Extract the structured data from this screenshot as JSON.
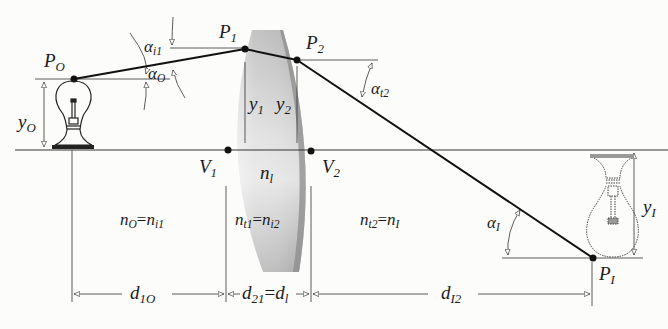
{
  "diagram": {
    "type": "thick-lens ray trace",
    "colors": {
      "background": "#fcfcfa",
      "ink": "#1a1a1a",
      "lens_light": "#e4e4e4",
      "lens_dark": "#9a9a9a"
    },
    "points": {
      "P_O": {
        "base": "P",
        "sub": "O"
      },
      "P_1": {
        "base": "P",
        "sub": "1"
      },
      "P_2": {
        "base": "P",
        "sub": "2"
      },
      "P_I": {
        "base": "P",
        "sub": "I"
      },
      "V_1": {
        "base": "V",
        "sub": "1"
      },
      "V_2": {
        "base": "V",
        "sub": "2"
      }
    },
    "angles": {
      "alpha_i1": {
        "base": "α",
        "sub": "i1"
      },
      "alpha_O": {
        "base": "α",
        "sub": "O"
      },
      "alpha_t2": {
        "base": "α",
        "sub": "t2"
      },
      "alpha_I": {
        "base": "α",
        "sub": "I"
      }
    },
    "heights": {
      "y_O": {
        "base": "y",
        "sub": "O"
      },
      "y_1": {
        "base": "y",
        "sub": "1"
      },
      "y_2": {
        "base": "y",
        "sub": "2"
      },
      "y_I": {
        "base": "y",
        "sub": "I"
      }
    },
    "indices": {
      "n_l": {
        "base": "n",
        "sub": "l"
      },
      "object_side": {
        "lhs_base": "n",
        "lhs_sub": "O",
        "eq": "=",
        "rhs_base": "n",
        "rhs_sub": "i1"
      },
      "lens": {
        "lhs_base": "n",
        "lhs_sub": "t1",
        "eq": "=",
        "rhs_base": "n",
        "rhs_sub": "i2"
      },
      "image_side": {
        "lhs_base": "n",
        "lhs_sub": "t2",
        "eq": "=",
        "rhs_base": "n",
        "rhs_sub": "I"
      }
    },
    "distances": {
      "d_1O": {
        "base": "d",
        "sub": "1O"
      },
      "d_21": {
        "lhs_base": "d",
        "lhs_sub": "21",
        "eq": "=",
        "rhs_base": "d",
        "rhs_sub": "l"
      },
      "d_I2": {
        "base": "d",
        "sub": "I2"
      }
    },
    "objects": {
      "object_bulb": "upright light bulb (object)",
      "image_bulb": "inverted light bulb (image, dashed)"
    }
  }
}
